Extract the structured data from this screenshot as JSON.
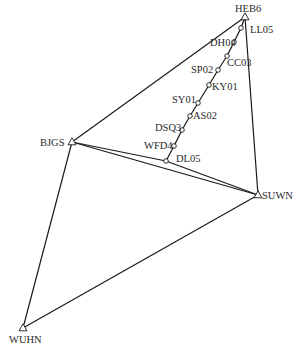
{
  "diagram": {
    "type": "geodetic-control-network",
    "control_stations": [
      {
        "id": "HEB6",
        "label": "HEB6",
        "x": 245,
        "y": 17,
        "lx": 235,
        "ly": 12,
        "symbol": "triangle"
      },
      {
        "id": "BJGS",
        "label": "BJGS",
        "x": 72,
        "y": 142,
        "lx": 40,
        "ly": 146,
        "symbol": "triangle"
      },
      {
        "id": "SUWN",
        "label": "SUWN",
        "x": 258,
        "y": 195,
        "lx": 262,
        "ly": 199,
        "symbol": "triangle"
      },
      {
        "id": "WUHN",
        "label": "WUHN",
        "x": 23,
        "y": 328,
        "lx": 9,
        "ly": 343,
        "symbol": "triangle"
      }
    ],
    "survey_points": [
      {
        "id": "LL05",
        "label": "LL05",
        "x": 241,
        "y": 28,
        "lx": 250,
        "ly": 33
      },
      {
        "id": "DH04",
        "label": "DH04",
        "x": 234,
        "y": 42,
        "lx": 210,
        "ly": 46
      },
      {
        "id": "CC03",
        "label": "CC03",
        "x": 227,
        "y": 56,
        "lx": 227,
        "ly": 66
      },
      {
        "id": "SP02",
        "label": "SP02",
        "x": 218,
        "y": 70,
        "lx": 191,
        "ly": 73
      },
      {
        "id": "KY01",
        "label": "KY01",
        "x": 209,
        "y": 85,
        "lx": 212,
        "ly": 90
      },
      {
        "id": "SY01",
        "label": "SY01",
        "x": 198,
        "y": 103,
        "lx": 172,
        "ly": 103
      },
      {
        "id": "AS02",
        "label": "AS02",
        "x": 190,
        "y": 116,
        "lx": 193,
        "ly": 119
      },
      {
        "id": "DSQ3",
        "label": "DSQ3",
        "x": 182,
        "y": 130,
        "lx": 155,
        "ly": 131
      },
      {
        "id": "WFD4",
        "label": "WFD4",
        "x": 174,
        "y": 146,
        "lx": 144,
        "ly": 149
      },
      {
        "id": "DL05",
        "label": "DL05",
        "x": 166,
        "y": 161,
        "lx": 176,
        "ly": 162
      }
    ],
    "edges": [
      [
        "HEB6",
        "BJGS"
      ],
      [
        "HEB6",
        "SUWN"
      ],
      [
        "BJGS",
        "SUWN"
      ],
      [
        "BJGS",
        "DL05"
      ],
      [
        "DL05",
        "SUWN"
      ],
      [
        "BJGS",
        "WUHN"
      ],
      [
        "WUHN",
        "SUWN"
      ],
      [
        "HEB6",
        "LL05"
      ],
      [
        "LL05",
        "DH04"
      ],
      [
        "DH04",
        "CC03"
      ],
      [
        "CC03",
        "SP02"
      ],
      [
        "SP02",
        "KY01"
      ],
      [
        "KY01",
        "SY01"
      ],
      [
        "SY01",
        "AS02"
      ],
      [
        "AS02",
        "DSQ3"
      ],
      [
        "DSQ3",
        "WFD4"
      ],
      [
        "WFD4",
        "DL05"
      ]
    ]
  }
}
